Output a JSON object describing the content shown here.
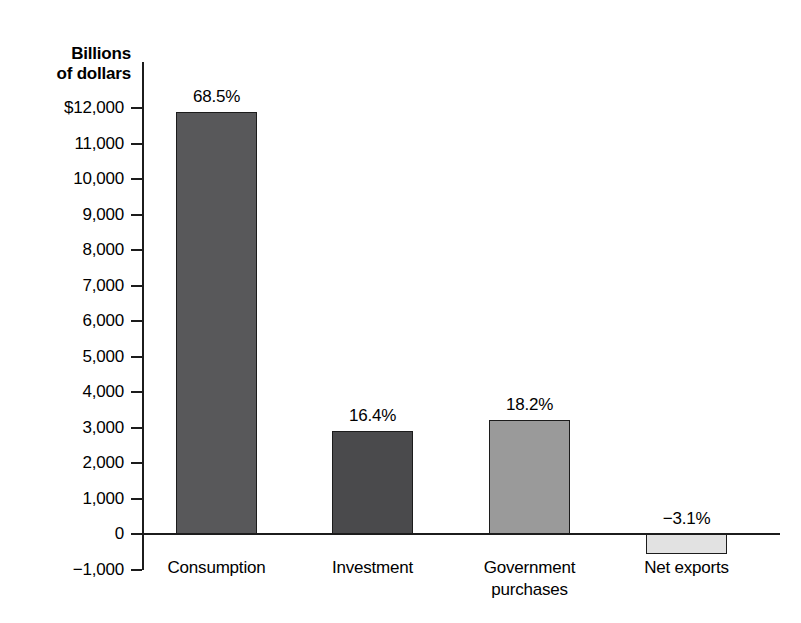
{
  "chart_data": {
    "type": "bar",
    "title": "",
    "axis_title_lines": [
      "Billions",
      "of dollars"
    ],
    "xlabel": "",
    "ylabel": "Billions of dollars",
    "ylim": [
      -1000,
      12000
    ],
    "ytick_step": 1000,
    "grid": false,
    "legend": "none",
    "ytick_labels": [
      "$12,000",
      "11,000",
      "10,000",
      "9,000",
      "8,000",
      "7,000",
      "6,000",
      "5,000",
      "4,000",
      "3,000",
      "2,000",
      "1,000",
      "0",
      "−1,000"
    ],
    "ytick_values": [
      12000,
      11000,
      10000,
      9000,
      8000,
      7000,
      6000,
      5000,
      4000,
      3000,
      2000,
      1000,
      0,
      -1000
    ],
    "categories": [
      "Consumption",
      "Investment",
      "Government purchases",
      "Net exports"
    ],
    "values": [
      11900,
      2900,
      3200,
      -550
    ],
    "data_labels": [
      "68.5%",
      "16.4%",
      "18.2%",
      "−3.1%"
    ],
    "bars": [
      {
        "category": "Consumption",
        "category_lines": [
          "Consumption"
        ],
        "value": 11900,
        "data_label": "68.5%",
        "share_percent": 68.5,
        "fill": "#58585a"
      },
      {
        "category": "Investment",
        "category_lines": [
          "Investment"
        ],
        "value": 2900,
        "data_label": "16.4%",
        "share_percent": 16.4,
        "fill": "#4a4a4c"
      },
      {
        "category": "Government purchases",
        "category_lines": [
          "Government",
          "purchases"
        ],
        "value": 3200,
        "data_label": "18.2%",
        "share_percent": 18.2,
        "fill": "#9a9a9a"
      },
      {
        "category": "Net exports",
        "category_lines": [
          "Net exports"
        ],
        "value": -550,
        "data_label": "−3.1%",
        "share_percent": -3.1,
        "fill": "#e2e2e2"
      }
    ],
    "colors": {
      "axis": "#1c1c1c",
      "background": "#ffffff",
      "text": "#000000"
    }
  }
}
